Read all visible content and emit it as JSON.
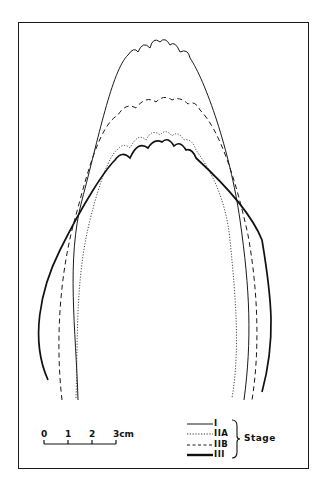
{
  "figure": {
    "stroke_color": "#1a1a1a",
    "background": "#ffffff"
  },
  "scale_bar": {
    "ticks": [
      "0",
      "1",
      "2",
      "3cm"
    ]
  },
  "legend": {
    "title": "Stage",
    "items": [
      {
        "label": "I",
        "style": "solid-thin"
      },
      {
        "label": "IIA",
        "style": "dotted"
      },
      {
        "label": "IIB",
        "style": "dashed"
      },
      {
        "label": "III",
        "style": "solid-thick"
      }
    ]
  }
}
